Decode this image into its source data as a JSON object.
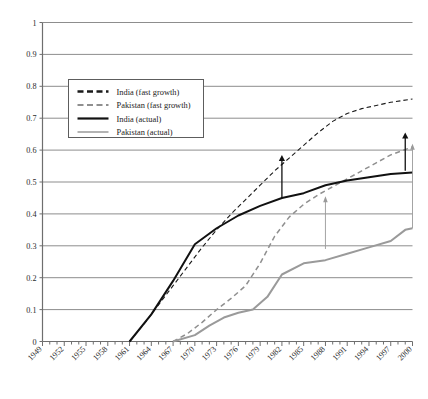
{
  "chart_data": {
    "type": "line",
    "title": "",
    "subtitle": "",
    "xlabel": "",
    "ylabel": "",
    "xlim": [
      1949,
      2000
    ],
    "ylim": [
      0,
      1
    ],
    "grid": "horizontal",
    "legend_position": "upper-left-inside",
    "y_ticks": [
      "0",
      "0.1",
      "0.2",
      "0.3",
      "0.4",
      "0.5",
      "0.6",
      "0.7",
      "0.8",
      "0.9",
      "1"
    ],
    "y_tick_values": [
      0,
      0.1,
      0.2,
      0.3,
      0.4,
      0.5,
      0.6,
      0.7,
      0.8,
      0.9,
      1
    ],
    "x_ticks": [
      "1949",
      "1952",
      "1955",
      "1958",
      "1961",
      "1964",
      "1967",
      "1970",
      "1973",
      "1976",
      "1979",
      "1982",
      "1985",
      "1988",
      "1991",
      "1994",
      "1997",
      "2000"
    ],
    "x_tick_values": [
      1949,
      1952,
      1955,
      1958,
      1961,
      1964,
      1967,
      1970,
      1973,
      1976,
      1979,
      1982,
      1985,
      1988,
      1991,
      1994,
      1997,
      2000
    ],
    "x_minor_step": 1,
    "series": [
      {
        "name": "India (fast growth)",
        "style": "dashed",
        "color": "#1a1a1a",
        "width": 1.1,
        "x": [
          1961,
          1963,
          1965,
          1967,
          1969,
          1971,
          1973,
          1975,
          1977,
          1979,
          1981,
          1983,
          1985,
          1987,
          1989,
          1991,
          1993,
          1995,
          1997,
          2000
        ],
        "values": [
          0.0,
          0.055,
          0.115,
          0.175,
          0.235,
          0.295,
          0.35,
          0.4,
          0.445,
          0.49,
          0.535,
          0.575,
          0.615,
          0.655,
          0.69,
          0.715,
          0.73,
          0.74,
          0.75,
          0.76
        ]
      },
      {
        "name": "Pakistan (fast growth)",
        "style": "dashed",
        "color": "#8f8f8f",
        "width": 1.5,
        "x": [
          1967,
          1969,
          1971,
          1973,
          1975,
          1977,
          1979,
          1981,
          1983,
          1985,
          1987,
          1989,
          1991,
          1993,
          1995,
          1997,
          2000
        ],
        "values": [
          0.0,
          0.025,
          0.06,
          0.1,
          0.135,
          0.175,
          0.245,
          0.33,
          0.39,
          0.43,
          0.46,
          0.485,
          0.51,
          0.535,
          0.56,
          0.585,
          0.61
        ]
      },
      {
        "name": "India (actual)",
        "style": "solid",
        "color": "#111111",
        "width": 2.0,
        "x": [
          1961,
          1964,
          1967,
          1970,
          1973,
          1976,
          1979,
          1982,
          1985,
          1988,
          1991,
          1994,
          1997,
          2000
        ],
        "values": [
          0.0,
          0.085,
          0.19,
          0.305,
          0.355,
          0.395,
          0.425,
          0.45,
          0.465,
          0.49,
          0.505,
          0.515,
          0.525,
          0.53
        ]
      },
      {
        "name": "Pakistan (actual)",
        "style": "solid",
        "color": "#9a9a9a",
        "width": 2.0,
        "x": [
          1967,
          1970,
          1972,
          1974,
          1976,
          1978,
          1980,
          1982,
          1985,
          1988,
          1991,
          1994,
          1997,
          1999,
          2000
        ],
        "values": [
          0.0,
          0.02,
          0.05,
          0.075,
          0.09,
          0.1,
          0.14,
          0.21,
          0.245,
          0.255,
          0.275,
          0.295,
          0.315,
          0.35,
          0.355
        ]
      }
    ],
    "annotations": [
      {
        "name": "arrow-india-1982",
        "kind": "arrow-up",
        "x": 1982,
        "y0": 0.45,
        "y1": 0.585,
        "color": "#111111"
      },
      {
        "name": "arrow-pakistan-1988",
        "kind": "arrow-up",
        "x": 1988,
        "y0": 0.29,
        "y1": 0.455,
        "color": "#9a9a9a"
      },
      {
        "name": "arrow-india-2000",
        "kind": "arrow-up",
        "x": 1999,
        "y0": 0.535,
        "y1": 0.655,
        "color": "#111111"
      },
      {
        "name": "arrow-pakistan-2000",
        "kind": "arrow-up",
        "x": 2000,
        "y0": 0.355,
        "y1": 0.62,
        "color": "#9a9a9a"
      }
    ]
  },
  "legend": {
    "items": [
      {
        "label": "India (fast growth)"
      },
      {
        "label": "Pakistan (fast growth)"
      },
      {
        "label": "India (actual)"
      },
      {
        "label": "Pakistan (actual)"
      }
    ]
  },
  "colors": {
    "india": "#111111",
    "pakistan": "#9a9a9a",
    "grid": "#8d8d8d",
    "axis": "#6e6e6e",
    "background": "#ffffff"
  }
}
